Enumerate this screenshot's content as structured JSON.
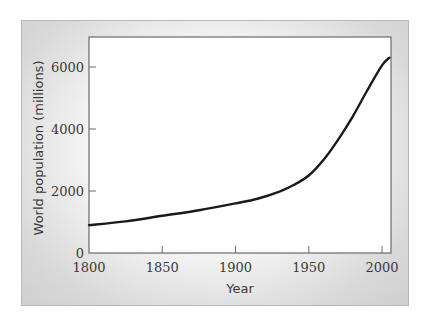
{
  "chart_data": {
    "type": "line",
    "title": "",
    "xlabel": "Year",
    "ylabel": "World population (millions)",
    "xlim": [
      1800,
      2005
    ],
    "ylim": [
      0,
      7000
    ],
    "x_ticks": [
      1800,
      1850,
      1900,
      1950,
      2000
    ],
    "y_ticks": [
      0,
      2000,
      4000,
      6000
    ],
    "grid": false,
    "legend": null,
    "series": [
      {
        "name": "World population",
        "color": "#1a1a1a",
        "x": [
          1800,
          1825,
          1850,
          1875,
          1900,
          1915,
          1930,
          1940,
          1950,
          1960,
          1970,
          1980,
          1990,
          2000,
          2005
        ],
        "values": [
          900,
          1020,
          1200,
          1380,
          1600,
          1750,
          1980,
          2200,
          2500,
          3000,
          3650,
          4400,
          5250,
          6050,
          6300
        ]
      }
    ]
  },
  "labels": {
    "xlabel": "Year",
    "ylabel": "World population (millions)",
    "x_ticks": [
      "1800",
      "1850",
      "1900",
      "1950",
      "2000"
    ],
    "y_ticks": [
      "0",
      "2000",
      "4000",
      "6000"
    ]
  }
}
